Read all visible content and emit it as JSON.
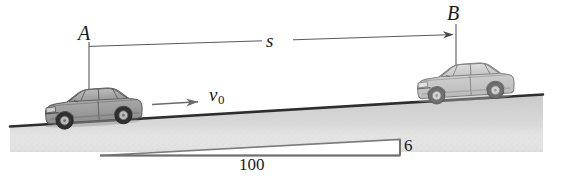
{
  "figure": {
    "kind": "physics-diagram",
    "background_color": "#ffffff",
    "ink_color": "#3a3a3a",
    "ground_fill_color": "#d8d8d8",
    "car_body_color": "#a9a9a9",
    "car_body_color_faded": "#c9c9c9"
  },
  "labels": {
    "point_a": "A",
    "point_b": "B",
    "distance": "s",
    "velocity_symbol": "v",
    "velocity_subscript": "0",
    "slope_run": "100",
    "slope_rise": "6"
  },
  "annotations": {
    "dimension_line_name": "distance-s-dimension",
    "velocity_arrow_name": "velocity-arrow",
    "slope_triangle_name": "slope-triangle"
  },
  "geometry": {
    "ground_left": {
      "x": 10,
      "y": 126
    },
    "ground_right": {
      "x": 543,
      "y": 94
    },
    "slope_ratio_rise": 6,
    "slope_ratio_run": 100,
    "dimension_a_x": 89,
    "dimension_b_x": 456,
    "dimension_y_left": 46,
    "dimension_y_right": 34
  }
}
